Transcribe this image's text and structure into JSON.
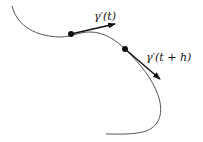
{
  "diagram": {
    "labels": {
      "tangent1": "γ′(t)",
      "tangent2": "γ′(t + h)"
    },
    "colors": {
      "curve": "#555555",
      "vector": "#111111",
      "point": "#111111"
    }
  }
}
